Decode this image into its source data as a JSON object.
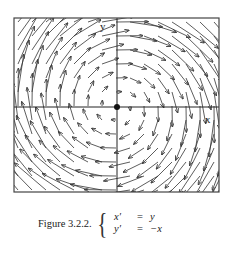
{
  "figure": {
    "type": "direction_field",
    "frame": {
      "x0": 14,
      "y0": 18,
      "x1": 219,
      "y1": 192
    },
    "origin_px": {
      "x": 117,
      "y": 107
    },
    "axis_labels": {
      "x": "x",
      "y": "y"
    },
    "line_color": "#333333",
    "origin_dot": true
  },
  "caption": {
    "label": "Figure 3.2.2.",
    "equations": [
      {
        "lhs": "x′",
        "eq": "=",
        "rhs": "y"
      },
      {
        "lhs": "y′",
        "eq": "=",
        "rhs": "−x"
      }
    ]
  }
}
